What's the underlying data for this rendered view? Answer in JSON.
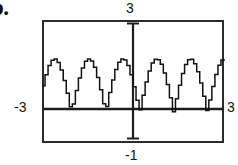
{
  "part": {
    "label": "b."
  },
  "window": {
    "top_label": "3",
    "left_label": "-3",
    "right_label": "3",
    "bottom_label": "-1"
  },
  "chart_data": {
    "type": "line",
    "title": "",
    "xlabel": "",
    "ylabel": "",
    "xlim": [
      -3,
      3
    ],
    "ylim": [
      -1,
      3
    ],
    "grid": false,
    "legend": null,
    "axes": {
      "x_axis_at_y": 0,
      "y_axis_at_x": 0,
      "x_tick_labels": [
        "-3",
        "3"
      ],
      "y_tick_labels": [
        "-1",
        "3"
      ]
    },
    "series": [
      {
        "name": "y = |sin(3x)| approx",
        "peak_x": [
          -2.11,
          -1.07,
          -0.11,
          0.66,
          1.65,
          2.64
        ],
        "peak_y": [
          1.73,
          1.73,
          1.73,
          1.73,
          1.73,
          1.73
        ],
        "trough_y": 0,
        "x": [
          -3.0,
          -2.9,
          -2.8,
          -2.7,
          -2.6,
          -2.5,
          -2.4,
          -2.3,
          -2.2,
          -2.1,
          -2.0,
          -1.9,
          -1.8,
          -1.7,
          -1.6,
          -1.5,
          -1.4,
          -1.3,
          -1.2,
          -1.1,
          -1.0,
          -0.9,
          -0.8,
          -0.7,
          -0.6,
          -0.5,
          -0.4,
          -0.3,
          -0.2,
          -0.1,
          0.0,
          0.1,
          0.2,
          0.3,
          0.4,
          0.5,
          0.6,
          0.7,
          0.8,
          0.9,
          1.0,
          1.1,
          1.2,
          1.3,
          1.4,
          1.5,
          1.6,
          1.7,
          1.8,
          1.9,
          2.0,
          2.1,
          2.2,
          2.3,
          2.4,
          2.5,
          2.6,
          2.7,
          2.8,
          2.9,
          3.0
        ],
        "y": [
          0.86,
          1.22,
          1.52,
          1.69,
          1.73,
          1.62,
          1.37,
          1.03,
          0.62,
          0.18,
          0.27,
          0.71,
          1.11,
          1.44,
          1.66,
          1.73,
          1.67,
          1.46,
          1.13,
          0.73,
          0.28,
          0.19,
          0.64,
          1.05,
          1.39,
          1.63,
          1.73,
          1.7,
          1.52,
          1.22,
          0.83,
          0.39,
          0.08,
          0.55,
          0.98,
          1.34,
          1.6,
          1.72,
          1.71,
          1.56,
          1.28,
          0.9,
          0.47,
          0.02,
          0.44,
          0.88,
          1.26,
          1.55,
          1.71,
          1.72,
          1.58,
          1.32,
          0.95,
          0.52,
          0.06,
          0.4,
          0.84,
          1.23,
          1.53,
          1.7,
          1.73
        ]
      }
    ]
  }
}
